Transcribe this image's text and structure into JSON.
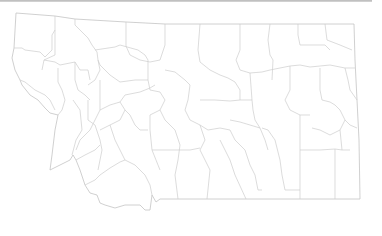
{
  "map": {
    "region": "Montana",
    "style": "county outline map",
    "colors": {
      "background": "#ffffff",
      "border": "#c4c4c4",
      "county_lines": "#cdcdcd",
      "top_bar": "#c0c0c0"
    }
  }
}
